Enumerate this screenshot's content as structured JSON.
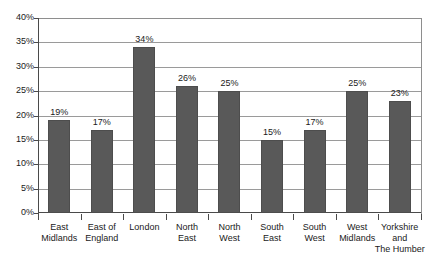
{
  "chart_data": {
    "type": "bar",
    "title": "",
    "xlabel": "",
    "ylabel": "",
    "ylim": [
      0,
      40
    ],
    "ytick_labels": [
      "0%",
      "5%",
      "10%",
      "15%",
      "20%",
      "25%",
      "30%",
      "35%",
      "40%"
    ],
    "ytick_values": [
      0,
      5,
      10,
      15,
      20,
      25,
      30,
      35,
      40
    ],
    "grid": "horizontal",
    "legend": "none",
    "bar_color": "#595959",
    "categories": [
      "East Midlands",
      "East of England",
      "London",
      "North East",
      "North West",
      "South East",
      "South West",
      "West Midlands",
      "Yorkshire and The Humber"
    ],
    "category_lines": [
      [
        "East",
        "Midlands"
      ],
      [
        "East of",
        "England"
      ],
      [
        "London"
      ],
      [
        "North",
        "East"
      ],
      [
        "North",
        "West"
      ],
      [
        "South",
        "East"
      ],
      [
        "South",
        "West"
      ],
      [
        "West",
        "Midlands"
      ],
      [
        "Yorkshire",
        "and",
        "The Humber"
      ]
    ],
    "values": [
      19,
      17,
      34,
      26,
      25,
      15,
      17,
      25,
      23
    ],
    "data_labels": [
      "19%",
      "17%",
      "34%",
      "26%",
      "25%",
      "15%",
      "17%",
      "25%",
      "23%"
    ]
  },
  "caption": {
    "text": ""
  }
}
